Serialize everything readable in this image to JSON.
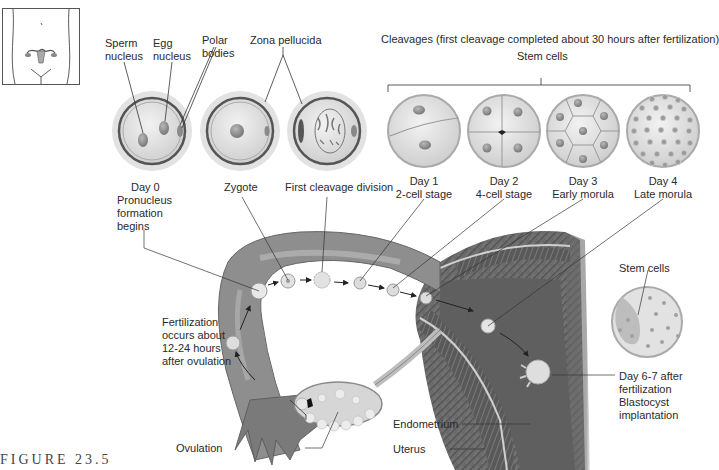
{
  "figure": {
    "caption": "FIGURE 23.5",
    "type": "embryology-diagram"
  },
  "header": {
    "cleavages_title": "Cleavages (first cleavage completed about 30 hours after fertilization)",
    "stem_cells_label": "Stem cells"
  },
  "top_labels": {
    "sperm_nucleus": [
      "Sperm",
      "nucleus"
    ],
    "egg_nucleus": [
      "Egg",
      "nucleus"
    ],
    "polar_bodies": [
      "Polar",
      "bodies"
    ],
    "zona_pellucida": "Zona pellucida"
  },
  "stages": [
    {
      "id": "day0",
      "lines": [
        "Day 0",
        "Pronucleus",
        "formation",
        "begins"
      ]
    },
    {
      "id": "zygote",
      "lines": [
        "Zygote"
      ]
    },
    {
      "id": "first-cleavage",
      "lines": [
        "First cleavage division"
      ]
    },
    {
      "id": "day1",
      "lines": [
        "Day 1",
        "2-cell stage"
      ]
    },
    {
      "id": "day2",
      "lines": [
        "Day 2",
        "4-cell stage"
      ]
    },
    {
      "id": "day3",
      "lines": [
        "Day 3",
        "Early morula"
      ]
    },
    {
      "id": "day4",
      "lines": [
        "Day 4",
        "Late morula"
      ]
    }
  ],
  "anatomy_labels": {
    "fertilization": [
      "Fertilization",
      "occurs about",
      "12-24 hours",
      "after ovulation"
    ],
    "ovulation": "Ovulation",
    "endometrium": "Endometrium",
    "uterus": "Uterus",
    "blastocyst_stem_cells": "Stem cells",
    "implantation": [
      "Day 6-7 after",
      "fertilization",
      "Blastocyst",
      "implantation"
    ]
  },
  "colors": {
    "tissue_dark": "#6e6e6e",
    "tissue_mid": "#8f8f8f",
    "cell_light": "#e4e4e4",
    "nucleus": "#9a9a9a",
    "line": "#333333"
  }
}
